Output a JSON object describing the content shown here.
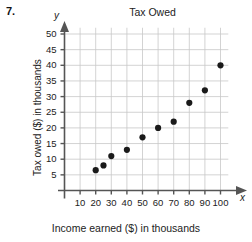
{
  "item": {
    "number": "7."
  },
  "axis_letters": {
    "x": "x",
    "y": "y"
  },
  "chart_data": {
    "type": "scatter",
    "title": "Tax Owed",
    "xlabel": "Income earned ($) in thousands",
    "ylabel": "Tax owed ($) in thousands",
    "xlim": [
      0,
      105
    ],
    "ylim": [
      0,
      52
    ],
    "grid": true,
    "legend": null,
    "xticks": [
      10,
      20,
      30,
      40,
      50,
      60,
      70,
      80,
      90,
      100
    ],
    "xtick_labels": [
      "10",
      "20",
      "30",
      "40",
      "50",
      "60",
      "70",
      "80",
      "90",
      "100"
    ],
    "yticks": [
      5,
      10,
      15,
      20,
      25,
      30,
      35,
      40,
      45,
      50
    ],
    "ytick_labels": [
      "5",
      "10",
      "15",
      "20",
      "25",
      "30",
      "35",
      "40",
      "45",
      "50"
    ],
    "x": [
      20,
      25,
      30,
      40,
      50,
      60,
      70,
      80,
      90,
      100
    ],
    "y": [
      6.5,
      8,
      11,
      13,
      17,
      20,
      22,
      28,
      32,
      40
    ],
    "points": [
      {
        "x": 20,
        "y": 6.5
      },
      {
        "x": 25,
        "y": 8
      },
      {
        "x": 30,
        "y": 11
      },
      {
        "x": 40,
        "y": 13
      },
      {
        "x": 50,
        "y": 17
      },
      {
        "x": 60,
        "y": 20
      },
      {
        "x": 70,
        "y": 22
      },
      {
        "x": 80,
        "y": 28
      },
      {
        "x": 90,
        "y": 32
      },
      {
        "x": 100,
        "y": 40
      }
    ],
    "marker_color": "#1a1a1a",
    "grid_color": "#c8c8c8",
    "axis_color": "#555555"
  }
}
